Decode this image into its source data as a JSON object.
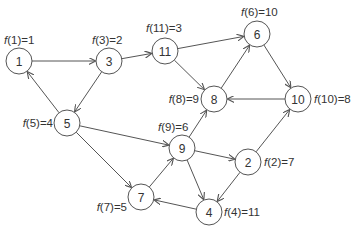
{
  "diagram": {
    "type": "directed-graph",
    "node_radius": 13,
    "colors": {
      "stroke": "#555555",
      "text": "#333333",
      "background": "#ffffff"
    },
    "nodes": [
      {
        "id": "1",
        "x": 19,
        "y": 61,
        "label": "1",
        "f_label": "f(1)=1",
        "lx": 4,
        "ly": 44,
        "anchor": "start"
      },
      {
        "id": "3",
        "x": 109,
        "y": 61,
        "label": "3",
        "f_label": "f(3)=2",
        "lx": 92,
        "ly": 44,
        "anchor": "start"
      },
      {
        "id": "11",
        "x": 165,
        "y": 51,
        "label": "11",
        "f_label": "f(11)=3",
        "lx": 146,
        "ly": 32,
        "anchor": "start"
      },
      {
        "id": "6",
        "x": 257,
        "y": 34,
        "label": "6",
        "f_label": "f(6)=10",
        "lx": 241,
        "ly": 16,
        "anchor": "start"
      },
      {
        "id": "8",
        "x": 214,
        "y": 99,
        "label": "8",
        "f_label": "f(8)=9",
        "lx": 199,
        "ly": 103,
        "anchor": "end"
      },
      {
        "id": "10",
        "x": 298,
        "y": 99,
        "label": "10",
        "f_label": "f(10)=8",
        "lx": 314,
        "ly": 103,
        "anchor": "start"
      },
      {
        "id": "5",
        "x": 67,
        "y": 123,
        "label": "5",
        "f_label": "f(5)=4",
        "lx": 53,
        "ly": 127,
        "anchor": "end"
      },
      {
        "id": "9",
        "x": 182,
        "y": 148,
        "label": "9",
        "f_label": "f(9)=6",
        "lx": 158,
        "ly": 131,
        "anchor": "start"
      },
      {
        "id": "2",
        "x": 248,
        "y": 162,
        "label": "2",
        "f_label": "f(2)=7",
        "lx": 264,
        "ly": 166,
        "anchor": "start"
      },
      {
        "id": "7",
        "x": 141,
        "y": 197,
        "label": "7",
        "f_label": "f(7)=5",
        "lx": 127,
        "ly": 211,
        "anchor": "end"
      },
      {
        "id": "4",
        "x": 209,
        "y": 212,
        "label": "4",
        "f_label": "f(4)=11",
        "lx": 224,
        "ly": 216,
        "anchor": "start"
      }
    ],
    "edges": [
      {
        "from": "1",
        "to": "3"
      },
      {
        "from": "3",
        "to": "11"
      },
      {
        "from": "3",
        "to": "5"
      },
      {
        "from": "5",
        "to": "1"
      },
      {
        "from": "11",
        "to": "6"
      },
      {
        "from": "11",
        "to": "8"
      },
      {
        "from": "8",
        "to": "6"
      },
      {
        "from": "6",
        "to": "10"
      },
      {
        "from": "10",
        "to": "8"
      },
      {
        "from": "5",
        "to": "9"
      },
      {
        "from": "5",
        "to": "7"
      },
      {
        "from": "7",
        "to": "9"
      },
      {
        "from": "9",
        "to": "8"
      },
      {
        "from": "9",
        "to": "2"
      },
      {
        "from": "9",
        "to": "4"
      },
      {
        "from": "2",
        "to": "10"
      },
      {
        "from": "2",
        "to": "4"
      },
      {
        "from": "4",
        "to": "7"
      }
    ]
  }
}
